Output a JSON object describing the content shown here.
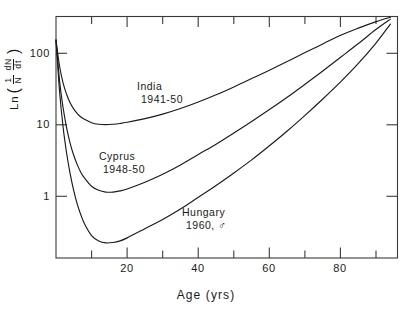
{
  "chart_data": {
    "type": "line",
    "title": "",
    "xlabel": "Age  (yrs)",
    "ylabel_text": "Ln ( 1/N dN/dt )",
    "ylabel_parts": {
      "prefix": "Ln",
      "open_paren": "(",
      "frac1_num": "1",
      "frac1_den": "N",
      "frac2_num": "dN",
      "frac2_den": "dt",
      "close_paren": ")"
    },
    "xlim": [
      0,
      96
    ],
    "ylim": [
      0.16,
      200
    ],
    "yscale": "log",
    "xticks_major": [
      20,
      40,
      60,
      80
    ],
    "xtick_labels": [
      "20",
      "40",
      "60",
      "80"
    ],
    "xticks_minor": [
      10,
      30,
      50,
      70,
      90
    ],
    "yticks": [
      1,
      10,
      100
    ],
    "ytick_labels": [
      "1",
      "10",
      "100"
    ],
    "grid": false,
    "legend": "inline-annotations",
    "series": [
      {
        "name": "India",
        "label_line1": "India",
        "label_line2": "1941-50",
        "color": "#1a1a1a",
        "points": [
          [
            0,
            100
          ],
          [
            1,
            46
          ],
          [
            2,
            28
          ],
          [
            3,
            20
          ],
          [
            4,
            15.5
          ],
          [
            5,
            13.0
          ],
          [
            6,
            11.4
          ],
          [
            7,
            10.3
          ],
          [
            8,
            9.6
          ],
          [
            10,
            8.7
          ],
          [
            12,
            8.3
          ],
          [
            14,
            8.2
          ],
          [
            16,
            8.3
          ],
          [
            18,
            8.5
          ],
          [
            20,
            8.8
          ],
          [
            25,
            9.8
          ],
          [
            30,
            11.2
          ],
          [
            35,
            13.2
          ],
          [
            40,
            16.0
          ],
          [
            45,
            19.8
          ],
          [
            50,
            25.0
          ],
          [
            55,
            32
          ],
          [
            60,
            41
          ],
          [
            65,
            53
          ],
          [
            70,
            69
          ],
          [
            75,
            89
          ],
          [
            80,
            115
          ],
          [
            85,
            142
          ],
          [
            90,
            172
          ],
          [
            94,
            196
          ]
        ]
      },
      {
        "name": "Cyprus",
        "label_line1": "Cyprus",
        "label_line2": "1948-50",
        "color": "#1a1a1a",
        "points": [
          [
            0,
            100
          ],
          [
            1,
            30
          ],
          [
            2,
            13.5
          ],
          [
            3,
            7.4
          ],
          [
            4,
            4.7
          ],
          [
            5,
            3.3
          ],
          [
            6,
            2.5
          ],
          [
            7,
            2.0
          ],
          [
            8,
            1.7
          ],
          [
            10,
            1.33
          ],
          [
            12,
            1.18
          ],
          [
            14,
            1.12
          ],
          [
            16,
            1.12
          ],
          [
            18,
            1.16
          ],
          [
            20,
            1.23
          ],
          [
            25,
            1.5
          ],
          [
            30,
            1.9
          ],
          [
            35,
            2.5
          ],
          [
            40,
            3.4
          ],
          [
            45,
            4.6
          ],
          [
            50,
            6.4
          ],
          [
            55,
            9.0
          ],
          [
            60,
            12.8
          ],
          [
            65,
            18.4
          ],
          [
            70,
            27
          ],
          [
            75,
            40
          ],
          [
            80,
            60
          ],
          [
            85,
            90
          ],
          [
            90,
            137
          ],
          [
            94,
            185
          ]
        ]
      },
      {
        "name": "Hungary",
        "label_line1": "Hungary",
        "label_line2": "1960, ♂",
        "color": "#1a1a1a",
        "points": [
          [
            0,
            100
          ],
          [
            1,
            22
          ],
          [
            2,
            7.6
          ],
          [
            3,
            3.5
          ],
          [
            4,
            1.9
          ],
          [
            5,
            1.16
          ],
          [
            6,
            0.78
          ],
          [
            7,
            0.57
          ],
          [
            8,
            0.44
          ],
          [
            10,
            0.31
          ],
          [
            12,
            0.265
          ],
          [
            14,
            0.25
          ],
          [
            16,
            0.253
          ],
          [
            18,
            0.265
          ],
          [
            20,
            0.29
          ],
          [
            25,
            0.38
          ],
          [
            30,
            0.5
          ],
          [
            35,
            0.68
          ],
          [
            40,
            0.96
          ],
          [
            45,
            1.36
          ],
          [
            50,
            1.97
          ],
          [
            55,
            2.9
          ],
          [
            60,
            4.4
          ],
          [
            65,
            6.8
          ],
          [
            70,
            10.8
          ],
          [
            75,
            17.5
          ],
          [
            80,
            29
          ],
          [
            85,
            50
          ],
          [
            90,
            92
          ],
          [
            94,
            160
          ]
        ]
      }
    ]
  },
  "axes": {
    "frame": "box",
    "tick_direction": "inward",
    "line_color": "#3a3a3a"
  }
}
